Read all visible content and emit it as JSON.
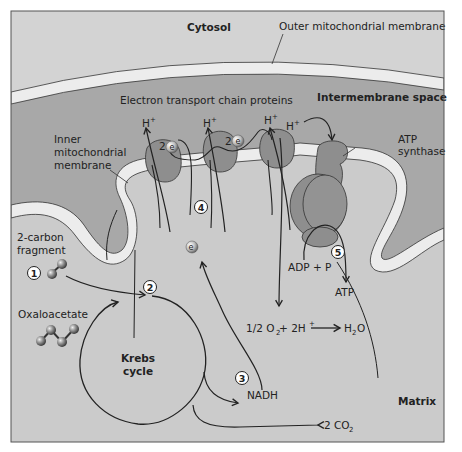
{
  "diagram": {
    "regions": {
      "cytosol": "Cytosol",
      "intermembrane_space": "Intermembrane space",
      "matrix": "Matrix"
    },
    "labels": {
      "outer_membrane": "Outer mitochondrial membrane",
      "etc_proteins": "Electron transport chain proteins",
      "inner_membrane_line1": "Inner",
      "inner_membrane_line2": "mitochondrial",
      "inner_membrane_line3": "membrane",
      "atp_synthase_line1": "ATP",
      "atp_synthase_line2": "synthase",
      "two_carbon_line1": "2-carbon",
      "two_carbon_line2": "fragment",
      "oxaloacetate": "Oxaloacetate",
      "krebs_line1": "Krebs",
      "krebs_line2": "cycle",
      "nadh": "NADH",
      "co2": "2 CO",
      "co2_sub": "2",
      "adp": "ADP + P",
      "atp": "ATP",
      "water_eq_left": "1/2 O",
      "water_eq_o_sub": "2",
      "water_eq_mid": " + 2H",
      "water_eq_plus": "+",
      "water_eq_h2o_h": "H",
      "water_eq_h2o_sub": "2",
      "water_eq_h2o_o": "O",
      "h_plus_base": "H",
      "h_plus_sup": "+",
      "two_e": "2",
      "e": "e",
      "e_sup": "−"
    },
    "step_numbers": [
      "1",
      "2",
      "3",
      "4",
      "5"
    ],
    "colors": {
      "cytosol": "#d4d4d4",
      "intermembrane": "#a9a9a9",
      "matrix": "#cdcdcd",
      "membrane": "#ececec",
      "protein": "#8f8f8f",
      "line": "#222222"
    }
  }
}
